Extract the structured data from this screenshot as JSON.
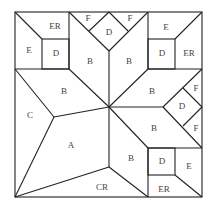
{
  "diagram": {
    "title": "",
    "type": "quilt-block-pattern",
    "labels": {
      "tl_er": "ER",
      "tl_e": "E",
      "tl_d": "D",
      "top_f_left": "F",
      "top_d": "D",
      "top_f_right": "F",
      "tr_e": "E",
      "tr_d": "D",
      "tr_er": "ER",
      "b_top_left": "B",
      "b_top_right": "B",
      "b_left": "B",
      "b_right_upper": "B",
      "c": "C",
      "a": "A",
      "right_f_top": "F",
      "right_d": "D",
      "right_f_bottom": "F",
      "b_right_lower": "B",
      "b_bottom": "B",
      "br_d": "D",
      "br_e": "E",
      "br_er": "ER",
      "cr": "CR"
    },
    "stroke_color": "#222222",
    "label_color": "#444444"
  }
}
